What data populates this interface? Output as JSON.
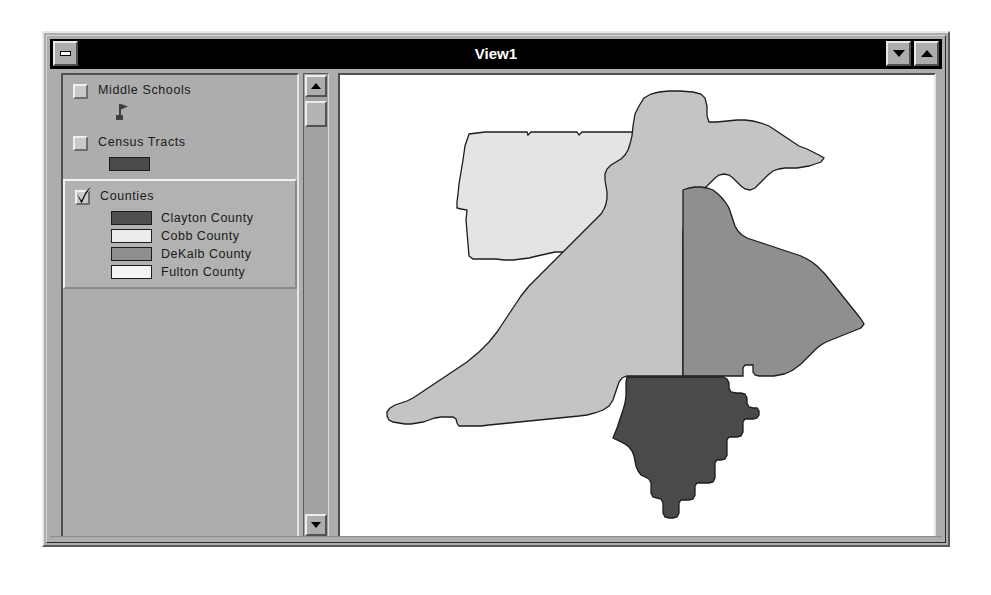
{
  "window": {
    "title": "View1",
    "system_menu_icon": "window-menu-icon",
    "minimize_icon": "triangle-down-icon",
    "maximize_icon": "triangle-up-icon"
  },
  "toc": {
    "scrollbar": {
      "up_arrow_icon": "scroll-up-arrow-icon",
      "down_arrow_icon": "scroll-down-arrow-icon"
    },
    "layers": [
      {
        "name": "Middle Schools",
        "checked": false,
        "selected": false,
        "symbol_type": "point",
        "symbols": [
          {
            "label": "",
            "icon": "flag-marker-icon",
            "color": "#5a5a5a"
          }
        ]
      },
      {
        "name": "Census Tracts",
        "checked": false,
        "selected": false,
        "symbol_type": "polygon",
        "symbols": [
          {
            "label": "",
            "color": "#4a4a4a"
          }
        ]
      },
      {
        "name": "Counties",
        "checked": true,
        "selected": true,
        "symbol_type": "polygon",
        "symbols": [
          {
            "label": "Clayton County",
            "color": "#4f4f4f"
          },
          {
            "label": "Cobb County",
            "color": "#ececec"
          },
          {
            "label": "DeKalb County",
            "color": "#8f8f8f"
          },
          {
            "label": "Fulton County",
            "color": "#f4f4f4"
          }
        ]
      }
    ]
  },
  "map": {
    "background": "#ffffff",
    "features": [
      {
        "name": "Cobb County",
        "fill": "#e4e4e4",
        "stroke": "#1c1c1c"
      },
      {
        "name": "Fulton County",
        "fill": "#c4c4c4",
        "stroke": "#1c1c1c"
      },
      {
        "name": "DeKalb County",
        "fill": "#8f8f8f",
        "stroke": "#1c1c1c"
      },
      {
        "name": "Clayton County",
        "fill": "#4a4a4a",
        "stroke": "#1c1c1c"
      }
    ]
  },
  "colors": {
    "face": "#adadad",
    "titlebar": "#000000",
    "titlebar_text": "#ffffff",
    "canvas": "#ffffff"
  }
}
